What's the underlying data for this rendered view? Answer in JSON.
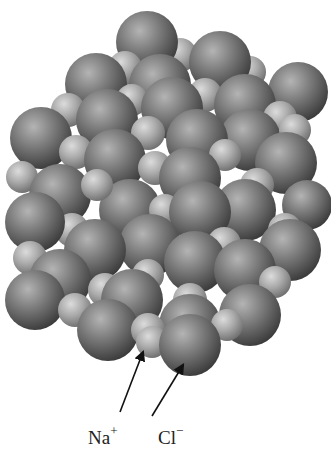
{
  "figure": {
    "background": "#ffffff"
  },
  "labels": [
    {
      "id": "na",
      "ion": "Na",
      "charge": "+",
      "x": 88,
      "y": 426
    },
    {
      "id": "cl",
      "ion": "Cl",
      "charge": "−",
      "x": 158,
      "y": 426
    }
  ],
  "arrows": [
    {
      "id": "na-arrow",
      "x1": 120,
      "y1": 412,
      "x2": 143,
      "y2": 352
    },
    {
      "id": "cl-arrow",
      "x1": 152,
      "y1": 416,
      "x2": 183,
      "y2": 365
    }
  ],
  "colors": {
    "cl_light": "#a9a9a9",
    "cl_dark": "#3f3f3f",
    "na_light": "#d2d2d2",
    "na_dark": "#7a7a7a",
    "arrow": "#111111"
  },
  "spheres": [
    {
      "t": "na",
      "x": 180,
      "y": 55,
      "r": 17
    },
    {
      "t": "cl",
      "x": 147,
      "y": 42,
      "r": 31
    },
    {
      "t": "na",
      "x": 125,
      "y": 68,
      "r": 17
    },
    {
      "t": "na",
      "x": 250,
      "y": 72,
      "r": 16
    },
    {
      "t": "cl",
      "x": 220,
      "y": 62,
      "r": 31
    },
    {
      "t": "cl",
      "x": 160,
      "y": 85,
      "r": 31
    },
    {
      "t": "cl",
      "x": 96,
      "y": 84,
      "r": 31
    },
    {
      "t": "na",
      "x": 205,
      "y": 95,
      "r": 17
    },
    {
      "t": "cl",
      "x": 298,
      "y": 92,
      "r": 30
    },
    {
      "t": "cl",
      "x": 245,
      "y": 105,
      "r": 31
    },
    {
      "t": "na",
      "x": 68,
      "y": 110,
      "r": 17
    },
    {
      "t": "na",
      "x": 132,
      "y": 100,
      "r": 16
    },
    {
      "t": "cl",
      "x": 172,
      "y": 108,
      "r": 31
    },
    {
      "t": "cl",
      "x": 107,
      "y": 120,
      "r": 31
    },
    {
      "t": "na",
      "x": 280,
      "y": 118,
      "r": 17
    },
    {
      "t": "cl",
      "x": 41,
      "y": 138,
      "r": 31
    },
    {
      "t": "na",
      "x": 148,
      "y": 133,
      "r": 17
    },
    {
      "t": "cl",
      "x": 250,
      "y": 140,
      "r": 31
    },
    {
      "t": "na",
      "x": 295,
      "y": 130,
      "r": 16
    },
    {
      "t": "cl",
      "x": 197,
      "y": 140,
      "r": 31
    },
    {
      "t": "na",
      "x": 76,
      "y": 152,
      "r": 17
    },
    {
      "t": "cl",
      "x": 115,
      "y": 160,
      "r": 31
    },
    {
      "t": "na",
      "x": 225,
      "y": 155,
      "r": 16
    },
    {
      "t": "cl",
      "x": 286,
      "y": 163,
      "r": 31
    },
    {
      "t": "na",
      "x": 155,
      "y": 168,
      "r": 17
    },
    {
      "t": "cl",
      "x": 190,
      "y": 178,
      "r": 31
    },
    {
      "t": "na",
      "x": 22,
      "y": 177,
      "r": 16
    },
    {
      "t": "cl",
      "x": 60,
      "y": 195,
      "r": 31
    },
    {
      "t": "na",
      "x": 257,
      "y": 185,
      "r": 17
    },
    {
      "t": "cl",
      "x": 307,
      "y": 205,
      "r": 25
    },
    {
      "t": "cl",
      "x": 130,
      "y": 210,
      "r": 31
    },
    {
      "t": "na",
      "x": 97,
      "y": 185,
      "r": 16
    },
    {
      "t": "cl",
      "x": 245,
      "y": 210,
      "r": 31
    },
    {
      "t": "na",
      "x": 165,
      "y": 210,
      "r": 16
    },
    {
      "t": "cl",
      "x": 200,
      "y": 212,
      "r": 31
    },
    {
      "t": "na",
      "x": 72,
      "y": 230,
      "r": 17
    },
    {
      "t": "na",
      "x": 285,
      "y": 230,
      "r": 17
    },
    {
      "t": "cl",
      "x": 35,
      "y": 222,
      "r": 30
    },
    {
      "t": "cl",
      "x": 150,
      "y": 245,
      "r": 31
    },
    {
      "t": "cl",
      "x": 95,
      "y": 250,
      "r": 31
    },
    {
      "t": "na",
      "x": 224,
      "y": 244,
      "r": 17
    },
    {
      "t": "cl",
      "x": 290,
      "y": 250,
      "r": 31
    },
    {
      "t": "na",
      "x": 30,
      "y": 258,
      "r": 17
    },
    {
      "t": "cl",
      "x": 195,
      "y": 262,
      "r": 31
    },
    {
      "t": "cl",
      "x": 245,
      "y": 270,
      "r": 31
    },
    {
      "t": "na",
      "x": 148,
      "y": 275,
      "r": 16
    },
    {
      "t": "cl",
      "x": 60,
      "y": 280,
      "r": 31
    },
    {
      "t": "na",
      "x": 275,
      "y": 282,
      "r": 16
    },
    {
      "t": "na",
      "x": 105,
      "y": 290,
      "r": 17
    },
    {
      "t": "cl",
      "x": 132,
      "y": 300,
      "r": 31
    },
    {
      "t": "cl",
      "x": 250,
      "y": 315,
      "r": 31
    },
    {
      "t": "na",
      "x": 190,
      "y": 300,
      "r": 17
    },
    {
      "t": "cl",
      "x": 35,
      "y": 300,
      "r": 30
    },
    {
      "t": "na",
      "x": 75,
      "y": 310,
      "r": 17
    },
    {
      "t": "cl",
      "x": 190,
      "y": 325,
      "r": 31
    },
    {
      "t": "cl",
      "x": 108,
      "y": 330,
      "r": 31
    },
    {
      "t": "na",
      "x": 227,
      "y": 325,
      "r": 16
    },
    {
      "t": "na",
      "x": 148,
      "y": 330,
      "r": 17
    },
    {
      "t": "na",
      "x": 152,
      "y": 342,
      "r": 16
    },
    {
      "t": "cl",
      "x": 190,
      "y": 345,
      "r": 31
    }
  ]
}
